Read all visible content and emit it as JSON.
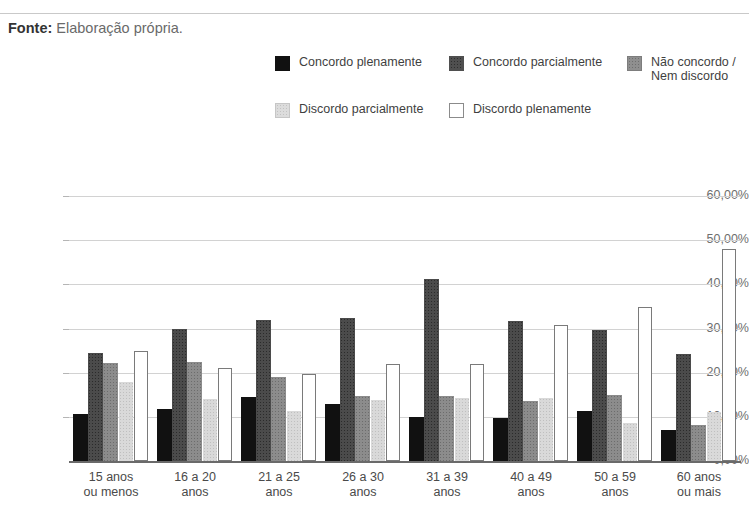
{
  "source_note": {
    "label": "Fonte:",
    "value": "Elaboração própria."
  },
  "chart_data": {
    "type": "bar",
    "title": "",
    "subtitle": "",
    "xlabel": "",
    "ylabel": "",
    "ylim": [
      0,
      60
    ],
    "ytick_labels": [
      "60,00%",
      "50,00%",
      "40,00%",
      "30,00%",
      "20,00%",
      "10,00%",
      "0,00%"
    ],
    "ytick_values": [
      60,
      50,
      40,
      30,
      20,
      10,
      0
    ],
    "grid": true,
    "legend_position": "top",
    "categories": [
      "15 anos ou menos",
      "16 a 20 anos",
      "21 a 25 anos",
      "26 a 30 anos",
      "31 a 39 anos",
      "40 a 49 anos",
      "50 a 59 anos",
      "60 anos ou mais"
    ],
    "category_lines": [
      [
        "15 anos",
        "ou menos"
      ],
      [
        "16 a 20",
        "anos"
      ],
      [
        "21 a 25",
        "anos"
      ],
      [
        "26 a 30",
        "anos"
      ],
      [
        "31 a 39",
        "anos"
      ],
      [
        "40 a 49",
        "anos"
      ],
      [
        "50 a 59",
        "anos"
      ],
      [
        "60 anos",
        "ou mais"
      ]
    ],
    "series": [
      {
        "name": "Concordo plenamente",
        "style": "black",
        "color": "#111111",
        "values": [
          10.6,
          11.8,
          14.5,
          12.8,
          9.9,
          9.8,
          11.4,
          7.0
        ]
      },
      {
        "name": "Concordo parcialmente",
        "style": "dark-gray-dotted",
        "color": "#4b4b4b",
        "values": [
          24.5,
          30.0,
          32.0,
          32.3,
          41.2,
          31.8,
          29.7,
          24.2
        ]
      },
      {
        "name": "Não concordo / Nem discordo",
        "style": "mid-gray-dotted",
        "color": "#8c8c8c",
        "values": [
          22.2,
          22.5,
          19.0,
          14.7,
          14.8,
          13.7,
          14.9,
          8.2
        ]
      },
      {
        "name": "Discordo parcialmente",
        "style": "light-gray-dotted",
        "color": "#d9d9d9",
        "values": [
          17.9,
          14.0,
          11.3,
          13.9,
          14.3,
          14.3,
          8.5,
          11.2
        ]
      },
      {
        "name": "Discordo plenamente",
        "style": "white-outline",
        "color": "#ffffff",
        "values": [
          24.8,
          21.0,
          19.7,
          22.0,
          22.0,
          30.7,
          34.8,
          48.0
        ]
      }
    ]
  },
  "legend": {
    "items": [
      {
        "label": "Concordo plenamente",
        "swatch": "legend-swatch-black"
      },
      {
        "label": "Concordo parcialmente",
        "swatch": "legend-swatch-dark-gray"
      },
      {
        "label": "Não concordo /\nNem discordo",
        "swatch": "legend-swatch-mid-gray"
      },
      {
        "label": "Discordo parcialmente",
        "swatch": "legend-swatch-light-gray"
      },
      {
        "label": "Discordo plenamente",
        "swatch": "legend-swatch-white"
      }
    ]
  }
}
